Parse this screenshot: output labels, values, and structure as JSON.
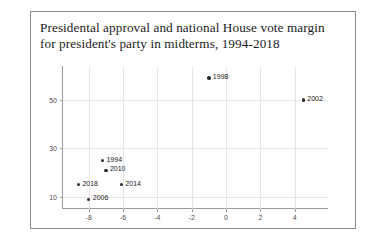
{
  "figure": {
    "title_lines": [
      "Presidental approval and national House vote margin",
      "for president's party in midterms, 1994-2018"
    ]
  },
  "chart_data": {
    "type": "scatter",
    "title": "Presidental approval and national House vote margin for president's party in midterms, 1994-2018",
    "xlabel": "National House vote margin",
    "ylabel": "Presidential Approval",
    "xlim": [
      -9.5,
      6.0
    ],
    "ylim": [
      5,
      64
    ],
    "xticks": [
      "-8",
      "-6",
      "-4",
      "-2",
      "0",
      "2",
      "4"
    ],
    "xtick_values": [
      -8,
      -6,
      -4,
      -2,
      0,
      2,
      4
    ],
    "yticks": [
      "50",
      "30",
      "10"
    ],
    "ytick_values": [
      50,
      30,
      10
    ],
    "grid": true,
    "legend": "none",
    "marker_color": "#2b2b2b",
    "points": [
      {
        "label": "1998",
        "x": -1.0,
        "y": 59
      },
      {
        "label": "2002",
        "x": 4.5,
        "y": 50
      },
      {
        "label": "1994",
        "x": -7.2,
        "y": 25
      },
      {
        "label": "2010",
        "x": -7.0,
        "y": 21
      },
      {
        "label": "2018",
        "x": -8.6,
        "y": 15
      },
      {
        "label": "2014",
        "x": -6.1,
        "y": 15
      },
      {
        "label": "2006",
        "x": -8.0,
        "y": 9
      }
    ]
  }
}
